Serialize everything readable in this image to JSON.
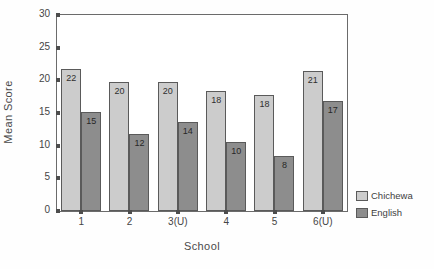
{
  "chart_data": {
    "type": "bar",
    "title": "",
    "xlabel": "School",
    "ylabel": "Mean Score",
    "categories": [
      "1",
      "2",
      "3(U)",
      "4",
      "5",
      "6(U)"
    ],
    "ylim": [
      0,
      30
    ],
    "yticks": [
      "0",
      "5",
      "10",
      "15",
      "20",
      "25",
      "30"
    ],
    "grid": false,
    "legend_position": "right",
    "series": [
      {
        "name": "Chichewa",
        "color": "#cccccc",
        "values": [
          22,
          20,
          20,
          18,
          18,
          21
        ],
        "bar_heights": [
          21.8,
          19.7,
          19.8,
          18.4,
          17.8,
          21.4
        ],
        "labels": [
          "22",
          "20",
          "20",
          "18",
          "18",
          "21"
        ]
      },
      {
        "name": "English",
        "color": "#8d8d8d",
        "values": [
          15,
          12,
          14,
          10,
          8,
          17
        ],
        "bar_heights": [
          15.1,
          11.8,
          13.6,
          10.5,
          8.4,
          16.8
        ],
        "labels": [
          "15",
          "12",
          "14",
          "10",
          "8",
          "17"
        ]
      }
    ]
  }
}
